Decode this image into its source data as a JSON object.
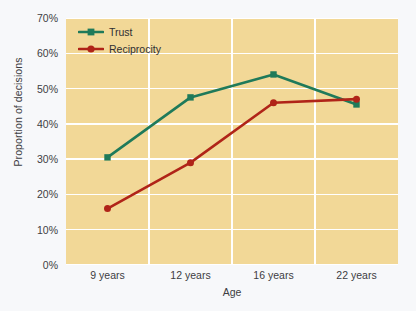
{
  "chart_data": {
    "type": "line",
    "title": "",
    "xlabel": "Age",
    "ylabel": "Proportion of decisions",
    "categories": [
      "9 years",
      "12 years",
      "16 years",
      "22 years"
    ],
    "ylim": [
      0,
      70
    ],
    "yticks": [
      "0%",
      "10%",
      "20%",
      "30%",
      "40%",
      "50%",
      "60%",
      "70%"
    ],
    "ytick_values": [
      0,
      10,
      20,
      30,
      40,
      50,
      60,
      70
    ],
    "grid": "horizontal-and-vertical",
    "legend_position": "top-left-inside",
    "plot_background": "#f2d897",
    "page_background": "#f7f8fa",
    "series": [
      {
        "name": "Trust",
        "color": "#1f7a5a",
        "marker": "square",
        "values": [
          30.5,
          47.5,
          54.0,
          45.5
        ]
      },
      {
        "name": "Reciprocity",
        "color": "#b02418",
        "marker": "circle",
        "values": [
          16.0,
          29.0,
          46.0,
          47.0
        ]
      }
    ]
  },
  "legend": {
    "entries": [
      {
        "label": "Trust",
        "color": "#1f7a5a",
        "marker": "square"
      },
      {
        "label": "Reciprocity",
        "color": "#b02418",
        "marker": "circle"
      }
    ]
  },
  "axes": {
    "y_title": "Proportion of decisions",
    "x_title": "Age"
  }
}
